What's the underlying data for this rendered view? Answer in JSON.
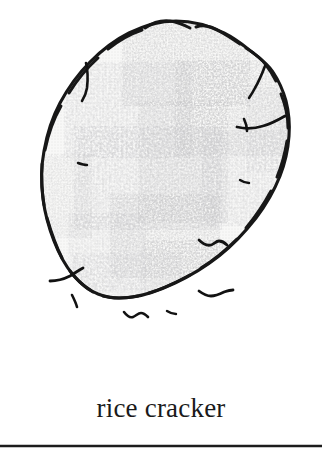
{
  "card": {
    "background_color": "#ffffff",
    "frame_color": "#1c1c1c",
    "frame_shape": "rounded-rectangle-bottom-visible"
  },
  "illustration": {
    "name": "rice-cracker-drawing",
    "subject": "rice cracker",
    "style": "hand-drawn ink outline with halftone stipple shading",
    "outline_color": "#171717",
    "fill_color": "#f4f4f3",
    "speckle_color": "#9a9a9a",
    "crack_color": "#121212",
    "description": "irregular tilted oval rice cracker with mottled toasted patches and small surface cracks"
  },
  "caption": {
    "label": "rice cracker",
    "color": "#1a1a1a"
  }
}
